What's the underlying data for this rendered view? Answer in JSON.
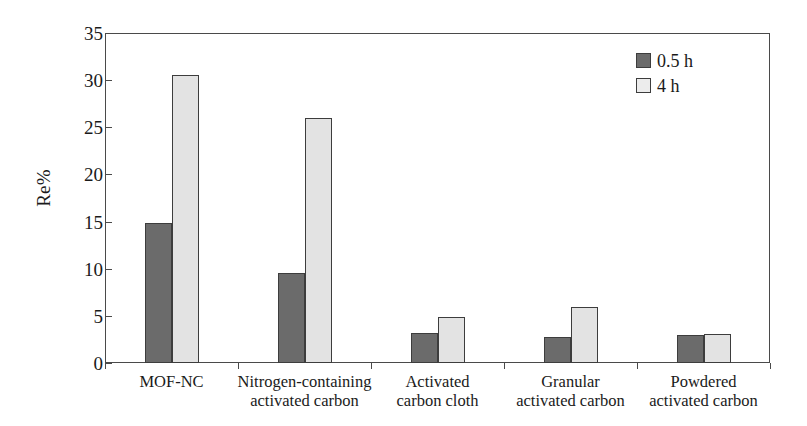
{
  "chart_data": {
    "type": "bar",
    "title": "",
    "subtitle": "",
    "xlabel": "",
    "ylabel": "Re%",
    "ylim": [
      0,
      35
    ],
    "yticks": [
      0,
      5,
      10,
      15,
      20,
      25,
      30,
      35
    ],
    "ytick_labels": [
      "0",
      "5",
      "10",
      "15",
      "20",
      "25",
      "30",
      "35"
    ],
    "grid": false,
    "legend_position": "top-right",
    "categories": [
      "MOF-NC",
      "Nitrogen-containing\nactivated carbon",
      "Activated\ncarbon cloth",
      "Granular\nactivated carbon",
      "Powdered\nactivated carbon"
    ],
    "series": [
      {
        "name": "0.5 h",
        "color": "#6b6b6b",
        "values": [
          14.8,
          9.5,
          3.2,
          2.8,
          3.0
        ]
      },
      {
        "name": "4 h",
        "color": "#e3e3e3",
        "values": [
          30.5,
          26.0,
          4.9,
          5.9,
          3.1
        ]
      }
    ]
  },
  "legend": {
    "items": [
      {
        "label": "0.5 h",
        "swatch": "dark-gray-swatch"
      },
      {
        "label": "4 h",
        "swatch": "light-gray-swatch"
      }
    ]
  },
  "axes": {
    "y_title": "Re%"
  },
  "colors": {
    "series_0": "#6b6b6b",
    "series_1": "#e3e3e3",
    "frame": "#4a4a4a",
    "text": "#1a1a1a",
    "background": "#ffffff"
  }
}
